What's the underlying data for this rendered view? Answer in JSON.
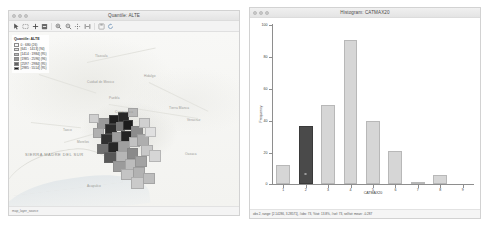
{
  "app": {
    "name": "GeoDa"
  },
  "map_window": {
    "title": "Quantile: ALTE",
    "titlebar_buttons": [
      "close-button",
      "minimize-button",
      "maximize-button"
    ],
    "toolbar": [
      {
        "name": "select-pointer-tool",
        "glyph": "pointer"
      },
      {
        "name": "select-rectangle-tool",
        "glyph": "rect-select"
      },
      {
        "name": "zoom-in-tool",
        "glyph": "plus"
      },
      {
        "name": "zoom-out-tool",
        "glyph": "minus-box"
      },
      {
        "name": "magnify-in-tool",
        "glyph": "magnify-plus"
      },
      {
        "name": "magnify-out-tool",
        "glyph": "magnify-minus"
      },
      {
        "name": "pan-tool",
        "glyph": "pan-arrows"
      },
      {
        "name": "full-extent-tool",
        "glyph": "extent"
      },
      {
        "name": "save-selection-tool",
        "glyph": "save-box"
      },
      {
        "name": "refresh-tool",
        "glyph": "refresh"
      }
    ],
    "legend": {
      "title": "Quantile: ALTE",
      "classes": [
        {
          "label": "0 : 680 (26)",
          "color": "#f7f7f7"
        },
        {
          "label": "[641 : 1413] (94)",
          "color": "#e0e0e0"
        },
        {
          "label": "[1414 : 1984] (95)",
          "color": "#bdbdbd"
        },
        {
          "label": "[1985 : 2596] (96)",
          "color": "#969696"
        },
        {
          "label": "[2597 : 2984] (95)",
          "color": "#636363"
        },
        {
          "label": "[2985 : 5514] (95)",
          "color": "#1a1a1a"
        }
      ]
    },
    "map_labels": [
      "Tlaxcala",
      "Cuidad de Mexico",
      "Puebla",
      "Morelos",
      "Hidalgo",
      "Cuernavaca",
      "SIERRA MADRE DEL SUR",
      "Oaxaca",
      "Veracruz",
      "Tierra Blanca",
      "Taxco",
      "Acapulco"
    ],
    "status": "map_layer_source"
  },
  "hist_window": {
    "title": "Histogram: CATMAX20",
    "titlebar_buttons": [
      "close-button",
      "minimize-button",
      "maximize-button"
    ],
    "status": "obs 2, range: [2.14286, 3.28571], #obs: 73, %tot: 13.8%, #sel: 73, sel/tot: mean: -0.287"
  },
  "chart_data": {
    "type": "bar",
    "title": "Histogram: CATMAX20",
    "xlabel": "CATMAX20",
    "ylabel": "Frequency",
    "categories": [
      "1",
      "2",
      "3",
      "4",
      "5",
      "6",
      "7",
      "8",
      "9"
    ],
    "values": [
      12,
      37,
      50,
      91,
      40,
      21,
      1,
      6,
      0
    ],
    "ylim": [
      0,
      100
    ],
    "yticks": [
      0,
      20,
      40,
      60,
      80,
      100
    ],
    "ytick_labels": [
      "0",
      "20",
      "40",
      "60",
      "80",
      "100"
    ],
    "selected_index": 1,
    "bar_color": "#d6d6d6",
    "selected_bar_color": "#4a4a4a",
    "grid": false,
    "legend": "none"
  }
}
